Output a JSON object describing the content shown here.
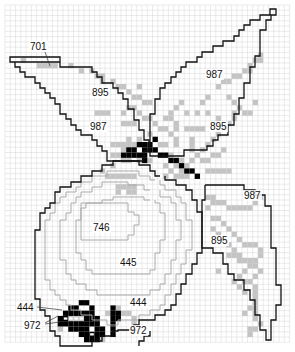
{
  "pattern": {
    "title": "Cross-stitch chart: apple with leaves",
    "grid": {
      "x0": 5,
      "y0": 5,
      "cols": 54,
      "rows": 64,
      "cell": 5.27
    },
    "colors": {
      "gray_fill": "#c4c4c4",
      "black_fill": "#000000",
      "grid": "#d6d6d6",
      "outline": "#111111",
      "inner_outline": "#a9a9a9"
    },
    "labels": [
      {
        "id": "label-701",
        "text": "701",
        "x": 30,
        "y": 50
      },
      {
        "id": "label-895-left-leaf",
        "text": "895",
        "x": 92,
        "y": 96
      },
      {
        "id": "label-987-left-leaf",
        "text": "987",
        "x": 90,
        "y": 130
      },
      {
        "id": "label-987-top-leaf",
        "text": "987",
        "x": 206,
        "y": 78
      },
      {
        "id": "label-895-top-leaf",
        "text": "895",
        "x": 210,
        "y": 130
      },
      {
        "id": "label-987-right-leaf",
        "text": "987",
        "x": 244,
        "y": 199
      },
      {
        "id": "label-895-right-leaf",
        "text": "895",
        "x": 211,
        "y": 244
      },
      {
        "id": "label-746",
        "text": "746",
        "x": 93,
        "y": 231
      },
      {
        "id": "label-445",
        "text": "445",
        "x": 120,
        "y": 266
      },
      {
        "id": "label-444-left",
        "text": "444",
        "x": 17,
        "y": 311
      },
      {
        "id": "label-444-right",
        "text": "444",
        "x": 130,
        "y": 306
      },
      {
        "id": "label-972-left",
        "text": "972",
        "x": 24,
        "y": 329
      },
      {
        "id": "label-972-right",
        "text": "972",
        "x": 130,
        "y": 334
      }
    ],
    "leaders": [
      {
        "points": "45,52 50,66"
      },
      {
        "points": "37,307 62,310"
      },
      {
        "points": "45,323 58,316"
      },
      {
        "points": "45,324 60,322"
      }
    ],
    "outlines_black": [
      {
        "id": "leaf-left",
        "points": "10,57 10,62 15,62 15,67 20,67 20,72 25,72 25,77 35,77 35,83 40,83 40,88 45,88 45,93 50,93 50,98 55,98 55,104 60,104 60,114 66,114 66,119 71,119 71,125 76,125 76,130 81,130 81,135 92,135 92,140 97,140 97,146 102,146 102,151 107,151 107,161 144,161 144,151 149,151 149,140 144,140 144,130 139,130 139,120 134,120 134,109 128,109 128,99 123,99 123,93 118,93 118,88 113,88 113,83 102,83 102,77 97,77 97,72 92,72 92,67 60,67 60,62 10,62 10,57 60,57 60,62"
      },
      {
        "id": "leaf-top",
        "points": "150,150 150,114 155,114 155,99 160,99 160,88 165,88 165,83 171,83 171,77 176,77 176,72 181,72 181,67 186,67 186,62 197,62 197,57 202,57 202,52 213,52 213,46 223,46 223,41 234,41 234,36 239,36 239,30 244,30 244,25 250,25 250,20 260,20 260,15 270,15 270,9 276,9 276,15 271,15 271,20 266,20 266,30 260,30 260,56 255,56 255,67 250,67 250,83 244,83 244,98 239,98 239,114 234,114 234,125 228,125 228,135 218,135 218,140 213,140 213,146 207,146 207,150 184,150 184,156 150,156 150,150"
      },
      {
        "id": "leaf-right",
        "points": "205,185 244,185 244,190 255,190 255,195 265,195 265,206 271,206 271,248 276,248 276,285 281,285 281,305 276,305 276,320 271,320 271,340 266,340 266,330 260,330 260,315 255,315 255,300 250,300 250,290 244,290 244,280 234,280 234,274 228,274 228,264 223,264 223,253 213,253 213,248 202,248 202,200 205,200 205,185"
      },
      {
        "id": "apple-outer",
        "points": "160,176 155,176 155,171 150,171 150,165 139,165 139,161 113,161 113,165 102,165 102,171 92,171 92,176 81,176 81,182 71,182 71,187 60,187 60,192 55,192 55,203 50,203 50,208 45,208 45,213 40,213 40,230 35,230 35,299 40,299 40,310 45,310 45,316 50,316 50,331 55,331 55,336 60,336 60,346 92,346 92,341 102,341 102,336 113,336 113,331 118,331 118,330 134,330 134,325 139,325 139,320 155,320 155,315 165,315 165,310 171,310 171,305 176,305 176,294 181,294 181,284 186,284 186,274 192,274 192,264 197,264 197,253 202,253 202,212 197,212 197,200 192,200 192,190 186,190 186,185 176,185 176,180 165,180 165,176"
      },
      {
        "id": "apple-inner-stub-right",
        "points": "139,346 139,341 144,341 144,336 150,336 150,331"
      }
    ],
    "outlines_gray": [
      {
        "id": "apple-ring-1",
        "points": "155,180 150,180 150,176 139,176 139,171 107,171 107,176 92,176 92,182 81,182 81,187 76,187 76,192 66,192 66,197 60,197 60,203 55,203 55,213 50,213 50,220 45,220 45,280 50,280 50,290 55,290 55,295 60,295 60,300 66,300 66,305 71,305 71,310 81,310 81,315 92,315 92,320 107,320 107,325 118,325 118,320 139,320 139,315 150,315 150,310 160,310 160,305 165,305 165,295 171,295 171,284 176,284 176,274 181,274 181,264 186,264 186,250 192,250 192,220 186,220 186,203 181,203 181,197 176,197 176,190 165,190 165,185 160,185 160,180"
      },
      {
        "id": "apple-ring-2",
        "points": "150,190 144,190 144,185 128,185 128,182 102,182 102,187 92,187 92,192 81,192 81,197 76,197 76,203 71,203 71,213 66,213 66,220 60,220 60,260 66,260 66,274 71,274 71,280 76,280 76,284 86,284 86,290 97,290 97,295 150,295 150,290 160,290 160,284 165,284 165,274 171,274 171,260 176,260 176,240 181,240 181,220 176,220 176,203 171,203 171,197 160,197 160,190"
      },
      {
        "id": "apple-ring-3",
        "points": "150,200 144,200 144,197 113,197 113,200 102,200 102,203 86,203 86,208 81,208 81,220 76,220 76,253 81,253 81,260 86,260 86,270 92,270 92,274 150,274 150,270 155,270 155,253 160,253 160,240 165,240 165,213 160,213 160,203 155,203 155,200"
      },
      {
        "id": "apple-highlight-746",
        "points": "81,203 81,240 128,240 128,235 134,235 134,225 139,225 139,215 134,215 134,212 128,212 128,203 81,203"
      }
    ],
    "cells_gray": [
      [
        3,
        10
      ],
      [
        6,
        11
      ],
      [
        7,
        11
      ],
      [
        8,
        11
      ],
      [
        9,
        11
      ],
      [
        12,
        11
      ],
      [
        14,
        12
      ],
      [
        16,
        12
      ],
      [
        17,
        13
      ],
      [
        18,
        13
      ],
      [
        18,
        14
      ],
      [
        20,
        14
      ],
      [
        21,
        15
      ],
      [
        22,
        15
      ],
      [
        25,
        15
      ],
      [
        23,
        16
      ],
      [
        24,
        17
      ],
      [
        25,
        17
      ],
      [
        26,
        18
      ],
      [
        27,
        18
      ],
      [
        17,
        20
      ],
      [
        18,
        20
      ],
      [
        19,
        20
      ],
      [
        22,
        20
      ],
      [
        23,
        19
      ],
      [
        24,
        19
      ],
      [
        25,
        20
      ],
      [
        26,
        21
      ],
      [
        27,
        21
      ],
      [
        22,
        22
      ],
      [
        23,
        22
      ],
      [
        24,
        22
      ],
      [
        28,
        22
      ],
      [
        29,
        23
      ],
      [
        30,
        23
      ],
      [
        31,
        24
      ],
      [
        27,
        24
      ],
      [
        25,
        25
      ],
      [
        23,
        25
      ],
      [
        20,
        26
      ],
      [
        21,
        26
      ],
      [
        22,
        26
      ],
      [
        23,
        26
      ],
      [
        24,
        26
      ],
      [
        29,
        26
      ],
      [
        30,
        26
      ],
      [
        27,
        27
      ],
      [
        28,
        27
      ],
      [
        28,
        25
      ],
      [
        24,
        27
      ],
      [
        22,
        28
      ],
      [
        22,
        29
      ],
      [
        23,
        29
      ],
      [
        25,
        29
      ],
      [
        27,
        29
      ],
      [
        29,
        28
      ],
      [
        30,
        28
      ],
      [
        31,
        28
      ],
      [
        31,
        20
      ],
      [
        31,
        21
      ],
      [
        32,
        22
      ],
      [
        32,
        23
      ],
      [
        32,
        25
      ],
      [
        32,
        26
      ],
      [
        37,
        18
      ],
      [
        38,
        17
      ],
      [
        40,
        15
      ],
      [
        41,
        14
      ],
      [
        42,
        14
      ],
      [
        43,
        13
      ],
      [
        44,
        13
      ],
      [
        45,
        12
      ],
      [
        46,
        12
      ],
      [
        46,
        11
      ],
      [
        47,
        10
      ],
      [
        48,
        10
      ],
      [
        48,
        9
      ],
      [
        44,
        19
      ],
      [
        45,
        20
      ],
      [
        46,
        20
      ],
      [
        47,
        18
      ],
      [
        42,
        17
      ],
      [
        43,
        18
      ],
      [
        43,
        20
      ],
      [
        43,
        21
      ],
      [
        42,
        22
      ],
      [
        41,
        23
      ],
      [
        40,
        24
      ],
      [
        39,
        25
      ],
      [
        38,
        26
      ],
      [
        37,
        27
      ],
      [
        36,
        28
      ],
      [
        35,
        29
      ],
      [
        34,
        30
      ],
      [
        33,
        31
      ],
      [
        34,
        23
      ],
      [
        35,
        23
      ],
      [
        36,
        23
      ],
      [
        37,
        23
      ],
      [
        39,
        22
      ],
      [
        40,
        21
      ],
      [
        38,
        20
      ],
      [
        36,
        20
      ],
      [
        34,
        20
      ],
      [
        32,
        19
      ],
      [
        33,
        18
      ],
      [
        30,
        21
      ],
      [
        31,
        29
      ],
      [
        32,
        30
      ],
      [
        33,
        29
      ],
      [
        37,
        29
      ],
      [
        38,
        29
      ],
      [
        39,
        28
      ],
      [
        40,
        28
      ],
      [
        41,
        27
      ],
      [
        35,
        25
      ],
      [
        35,
        26
      ],
      [
        35,
        27
      ],
      [
        36,
        32
      ],
      [
        38,
        31
      ],
      [
        39,
        31
      ],
      [
        40,
        31
      ],
      [
        41,
        31
      ],
      [
        42,
        31
      ],
      [
        30,
        30
      ],
      [
        31,
        31
      ],
      [
        32,
        32
      ],
      [
        33,
        32
      ],
      [
        34,
        32
      ],
      [
        30,
        32
      ],
      [
        20,
        28
      ],
      [
        21,
        28
      ],
      [
        22,
        27
      ],
      [
        20,
        30
      ],
      [
        18,
        31
      ],
      [
        19,
        32
      ],
      [
        20,
        32
      ],
      [
        21,
        32
      ],
      [
        22,
        32
      ],
      [
        23,
        32
      ],
      [
        24,
        32
      ],
      [
        21,
        34
      ],
      [
        22,
        34
      ],
      [
        23,
        34
      ],
      [
        24,
        34
      ],
      [
        21,
        35
      ],
      [
        23,
        35
      ],
      [
        24,
        35
      ],
      [
        38,
        36
      ],
      [
        39,
        36
      ],
      [
        39,
        37
      ],
      [
        40,
        37
      ],
      [
        41,
        37
      ],
      [
        42,
        38
      ],
      [
        43,
        38
      ],
      [
        44,
        38
      ],
      [
        45,
        38
      ],
      [
        46,
        38
      ],
      [
        47,
        37
      ],
      [
        48,
        36
      ],
      [
        38,
        38
      ],
      [
        39,
        40
      ],
      [
        40,
        40
      ],
      [
        41,
        41
      ],
      [
        42,
        42
      ],
      [
        43,
        43
      ],
      [
        44,
        44
      ],
      [
        45,
        45
      ],
      [
        46,
        45
      ],
      [
        47,
        45
      ],
      [
        48,
        46
      ],
      [
        48,
        47
      ],
      [
        47,
        48
      ],
      [
        46,
        49
      ],
      [
        45,
        50
      ],
      [
        44,
        51
      ],
      [
        43,
        52
      ],
      [
        44,
        53
      ],
      [
        45,
        54
      ],
      [
        45,
        52
      ],
      [
        46,
        52
      ],
      [
        47,
        51
      ],
      [
        48,
        50
      ],
      [
        47,
        49
      ],
      [
        46,
        48
      ],
      [
        39,
        42
      ],
      [
        40,
        43
      ],
      [
        41,
        44
      ],
      [
        42,
        45
      ],
      [
        43,
        46
      ],
      [
        47,
        53
      ],
      [
        47,
        54
      ],
      [
        47,
        55
      ],
      [
        47,
        56
      ],
      [
        47,
        57
      ],
      [
        47,
        58
      ],
      [
        47,
        59
      ],
      [
        48,
        60
      ],
      [
        46,
        57
      ],
      [
        45,
        58
      ],
      [
        46,
        61
      ],
      [
        47,
        61
      ],
      [
        42,
        47
      ],
      [
        43,
        47
      ],
      [
        44,
        47
      ],
      [
        44,
        48
      ],
      [
        45,
        48
      ],
      [
        40,
        50
      ],
      [
        46,
        62
      ],
      [
        11,
        59
      ],
      [
        12,
        59
      ],
      [
        13,
        59
      ],
      [
        14,
        59
      ],
      [
        19,
        58
      ],
      [
        20,
        58
      ],
      [
        21,
        57
      ],
      [
        22,
        58
      ],
      [
        23,
        58
      ],
      [
        24,
        59
      ],
      [
        24,
        60
      ],
      [
        10,
        60
      ],
      [
        10,
        61
      ],
      [
        17,
        62
      ],
      [
        18,
        63
      ],
      [
        16,
        62
      ]
    ],
    "cells_black": [
      [
        23,
        27
      ],
      [
        25,
        26
      ],
      [
        26,
        26
      ],
      [
        27,
        27
      ],
      [
        28,
        27
      ],
      [
        29,
        28
      ],
      [
        30,
        28
      ],
      [
        31,
        29
      ],
      [
        32,
        29
      ],
      [
        33,
        30
      ],
      [
        34,
        31
      ],
      [
        35,
        31
      ],
      [
        36,
        32
      ],
      [
        24,
        28
      ],
      [
        25,
        28
      ],
      [
        26,
        28
      ],
      [
        26,
        27
      ],
      [
        22,
        28
      ],
      [
        23,
        28
      ],
      [
        24,
        27
      ],
      [
        27,
        26
      ],
      [
        28,
        25
      ],
      [
        26,
        29
      ],
      [
        12,
        57
      ],
      [
        13,
        57
      ],
      [
        14,
        56
      ],
      [
        15,
        56
      ],
      [
        16,
        57
      ],
      [
        11,
        58
      ],
      [
        12,
        58
      ],
      [
        13,
        58
      ],
      [
        14,
        58
      ],
      [
        15,
        58
      ],
      [
        16,
        58
      ],
      [
        17,
        59
      ],
      [
        10,
        59
      ],
      [
        11,
        59
      ],
      [
        15,
        59
      ],
      [
        16,
        59
      ],
      [
        17,
        60
      ],
      [
        10,
        60
      ],
      [
        11,
        60
      ],
      [
        12,
        60
      ],
      [
        13,
        60
      ],
      [
        14,
        60
      ],
      [
        15,
        60
      ],
      [
        16,
        60
      ],
      [
        12,
        61
      ],
      [
        13,
        61
      ],
      [
        14,
        61
      ],
      [
        15,
        61
      ],
      [
        17,
        61
      ],
      [
        18,
        61
      ],
      [
        14,
        62
      ],
      [
        15,
        62
      ],
      [
        16,
        62
      ],
      [
        17,
        62
      ],
      [
        18,
        62
      ],
      [
        15,
        63
      ],
      [
        16,
        63
      ],
      [
        17,
        63
      ],
      [
        20,
        57
      ],
      [
        20,
        58
      ],
      [
        21,
        58
      ],
      [
        20,
        59
      ],
      [
        21,
        59
      ],
      [
        20,
        60
      ],
      [
        20,
        61
      ],
      [
        20,
        62
      ]
    ],
    "cells_white_overlay": [
      [
        11,
        59
      ],
      [
        12,
        59
      ],
      [
        13,
        59
      ],
      [
        14,
        59
      ],
      [
        16,
        61
      ],
      [
        16,
        62
      ]
    ]
  }
}
